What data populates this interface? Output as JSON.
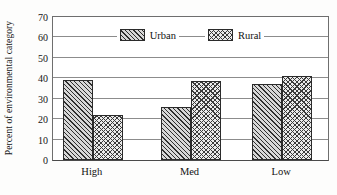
{
  "chart_data": {
    "type": "bar",
    "title": "",
    "xlabel": "",
    "ylabel": "Percent of environmental category",
    "categories": [
      "High",
      "Med",
      "Low"
    ],
    "series": [
      {
        "name": "Urban",
        "values": [
          39,
          26,
          37
        ]
      },
      {
        "name": "Rural",
        "values": [
          22,
          38.5,
          41
        ]
      }
    ],
    "ylim": [
      0,
      70
    ],
    "yticks": [
      0,
      10,
      20,
      30,
      40,
      50,
      60,
      70
    ],
    "ytick_labels": [
      "0",
      "10",
      "20",
      "30",
      "40",
      "50",
      "60",
      "70"
    ],
    "grid": true,
    "legend_position": "top-center",
    "legend": [
      {
        "label": "Urban",
        "pattern": "diagonal-hatch"
      },
      {
        "label": "Rural",
        "pattern": "crosshatch"
      }
    ]
  },
  "colors": {
    "urban_fill": "#d8d8d8",
    "rural_fill": "#ebebeb",
    "bar_outline": "#2b2b2b",
    "gridline": "#8c8c8c",
    "axis": "#4a4a4a",
    "background": "#fdfdfc"
  }
}
